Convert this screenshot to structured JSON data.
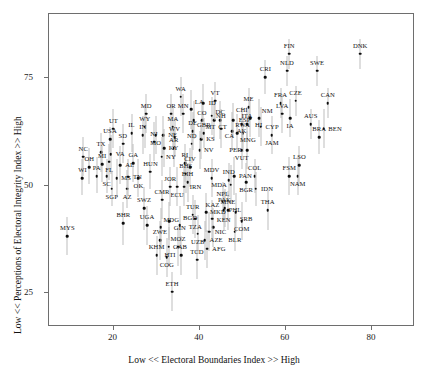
{
  "chart_data": {
    "type": "scatter",
    "title": "",
    "xlabel": "Low << Electoral Boundaries Index >> High",
    "ylabel": "Low << Perceptions of Electoral Integrity Index >> High",
    "xlim": [
      5,
      90
    ],
    "ylim": [
      17,
      90
    ],
    "xticks": [
      20,
      40,
      60,
      80
    ],
    "yticks": [
      25,
      50,
      75
    ],
    "grid": false,
    "legend": null,
    "points": [
      {
        "label": "MYS",
        "x": 9.5,
        "y": 38.0,
        "lo": 33.5,
        "hi": 42.5
      },
      {
        "label": "WI",
        "x": 13.0,
        "y": 51.5,
        "lo": 47.5,
        "hi": 56.0
      },
      {
        "label": "NC",
        "x": 13.2,
        "y": 56.5,
        "lo": 52.0,
        "hi": 61.0
      },
      {
        "label": "OH",
        "x": 14.6,
        "y": 54.0,
        "lo": 50.0,
        "hi": 58.5
      },
      {
        "label": "PA",
        "x": 16.3,
        "y": 52.0,
        "lo": 48.0,
        "hi": 56.5
      },
      {
        "label": "TX",
        "x": 17.3,
        "y": 57.5,
        "lo": 53.0,
        "hi": 62.0
      },
      {
        "label": "MI",
        "x": 17.6,
        "y": 54.8,
        "lo": 50.5,
        "hi": 59.0
      },
      {
        "label": "FL",
        "x": 19.2,
        "y": 55.3,
        "lo": 51.0,
        "hi": 59.5
      },
      {
        "label": "VA",
        "x": 19.6,
        "y": 57.0,
        "lo": 52.5,
        "hi": 61.5
      },
      {
        "label": "SC",
        "x": 18.6,
        "y": 52.0,
        "lo": 48.0,
        "hi": 56.0
      },
      {
        "label": "USA",
        "x": 19.4,
        "y": 60.5,
        "lo": 57.5,
        "hi": 63.5
      },
      {
        "label": "UT",
        "x": 20.2,
        "y": 63.0,
        "lo": 58.5,
        "hi": 67.5
      },
      {
        "label": "SGP",
        "x": 19.8,
        "y": 49.0,
        "lo": 45.0,
        "hi": 53.0
      },
      {
        "label": "MS",
        "x": 21.0,
        "y": 51.5,
        "lo": 47.0,
        "hi": 56.0
      },
      {
        "label": "AL",
        "x": 21.8,
        "y": 54.5,
        "lo": 50.0,
        "hi": 59.0
      },
      {
        "label": "SD",
        "x": 22.4,
        "y": 59.5,
        "lo": 55.0,
        "hi": 64.0
      },
      {
        "label": "BHR",
        "x": 22.5,
        "y": 41.0,
        "lo": 36.0,
        "hi": 46.0
      },
      {
        "label": "AZ",
        "x": 23.4,
        "y": 49.0,
        "lo": 44.5,
        "hi": 53.5
      },
      {
        "label": "TN",
        "x": 23.6,
        "y": 51.8,
        "lo": 47.5,
        "hi": 56.0
      },
      {
        "label": "IL",
        "x": 24.4,
        "y": 62.0,
        "lo": 57.5,
        "hi": 66.5
      },
      {
        "label": "GA",
        "x": 24.8,
        "y": 55.0,
        "lo": 50.5,
        "hi": 59.5
      },
      {
        "label": "OK",
        "x": 26.0,
        "y": 51.5,
        "lo": 47.0,
        "hi": 56.0
      },
      {
        "label": "IN",
        "x": 27.0,
        "y": 61.5,
        "lo": 57.0,
        "hi": 66.0
      },
      {
        "label": "WY",
        "x": 27.5,
        "y": 63.5,
        "lo": 58.5,
        "hi": 68.5
      },
      {
        "label": "MD",
        "x": 27.8,
        "y": 66.5,
        "lo": 62.0,
        "hi": 71.0
      },
      {
        "label": "SWZ",
        "x": 27.3,
        "y": 44.5,
        "lo": 39.5,
        "hi": 49.5
      },
      {
        "label": "UGA",
        "x": 28.0,
        "y": 40.5,
        "lo": 36.0,
        "hi": 45.0
      },
      {
        "label": "HUN",
        "x": 28.8,
        "y": 53.0,
        "lo": 49.0,
        "hi": 57.0
      },
      {
        "label": "NJ",
        "x": 29.6,
        "y": 60.0,
        "lo": 55.5,
        "hi": 64.5
      },
      {
        "label": "MO",
        "x": 30.0,
        "y": 61.5,
        "lo": 57.0,
        "hi": 66.0
      },
      {
        "label": "KHM",
        "x": 30.2,
        "y": 33.5,
        "lo": 29.0,
        "hi": 38.0
      },
      {
        "label": "ZWE",
        "x": 31.0,
        "y": 37.0,
        "lo": 32.5,
        "hi": 41.5
      },
      {
        "label": "MDG",
        "x": 31.2,
        "y": 40.0,
        "lo": 35.5,
        "hi": 44.5
      },
      {
        "label": "NY",
        "x": 31.4,
        "y": 56.5,
        "lo": 52.0,
        "hi": 61.0
      },
      {
        "label": "NE",
        "x": 31.8,
        "y": 61.5,
        "lo": 57.0,
        "hi": 66.0
      },
      {
        "label": "KY",
        "x": 32.0,
        "y": 58.5,
        "lo": 54.0,
        "hi": 63.0
      },
      {
        "label": "CMR",
        "x": 31.5,
        "y": 46.5,
        "lo": 42.0,
        "hi": 51.0
      },
      {
        "label": "COG",
        "x": 32.6,
        "y": 33.0,
        "lo": 28.5,
        "hi": 37.5
      },
      {
        "label": "GAB",
        "x": 33.0,
        "y": 35.5,
        "lo": 31.0,
        "hi": 40.0
      },
      {
        "label": "GIN",
        "x": 33.2,
        "y": 41.5,
        "lo": 37.0,
        "hi": 46.0
      },
      {
        "label": "ETH",
        "x": 33.8,
        "y": 25.0,
        "lo": 20.5,
        "hi": 29.5
      },
      {
        "label": "JOR",
        "x": 33.4,
        "y": 49.5,
        "lo": 45.0,
        "hi": 54.0
      },
      {
        "label": "OR",
        "x": 33.6,
        "y": 66.5,
        "lo": 62.0,
        "hi": 71.0
      },
      {
        "label": "MA",
        "x": 34.0,
        "y": 63.5,
        "lo": 59.0,
        "hi": 68.0
      },
      {
        "label": "AR",
        "x": 34.2,
        "y": 58.5,
        "lo": 54.0,
        "hi": 63.0
      },
      {
        "label": "WV",
        "x": 34.4,
        "y": 61.0,
        "lo": 56.5,
        "hi": 65.5
      },
      {
        "label": "ECU",
        "x": 35.0,
        "y": 49.5,
        "lo": 45.0,
        "hi": 54.0
      },
      {
        "label": "MOZ",
        "x": 35.2,
        "y": 35.5,
        "lo": 31.0,
        "hi": 40.0
      },
      {
        "label": "BGD",
        "x": 35.6,
        "y": 40.5,
        "lo": 36.0,
        "hi": 45.0
      },
      {
        "label": "WA",
        "x": 35.8,
        "y": 70.5,
        "lo": 66.0,
        "hi": 75.0
      },
      {
        "label": "MN",
        "x": 36.4,
        "y": 66.5,
        "lo": 62.0,
        "hi": 71.0
      },
      {
        "label": "HTI",
        "x": 36.0,
        "y": 33.5,
        "lo": 29.0,
        "hi": 38.0
      },
      {
        "label": "IRN",
        "x": 36.6,
        "y": 49.5,
        "lo": 45.0,
        "hi": 54.0
      },
      {
        "label": "RI",
        "x": 36.8,
        "y": 55.0,
        "lo": 50.5,
        "hi": 59.5
      },
      {
        "label": "BHS",
        "x": 37.0,
        "y": 52.5,
        "lo": 48.0,
        "hi": 57.0
      },
      {
        "label": "BIH",
        "x": 37.4,
        "y": 50.5,
        "lo": 46.0,
        "hi": 55.0
      },
      {
        "label": "CIV",
        "x": 38.0,
        "y": 54.0,
        "lo": 49.5,
        "hi": 58.5
      },
      {
        "label": "ND",
        "x": 38.4,
        "y": 59.5,
        "lo": 55.0,
        "hi": 64.0
      },
      {
        "label": "DE",
        "x": 38.6,
        "y": 62.5,
        "lo": 58.0,
        "hi": 67.0
      },
      {
        "label": "CO",
        "x": 38.8,
        "y": 65.0,
        "lo": 60.5,
        "hi": 69.5
      },
      {
        "label": "LA",
        "x": 38.2,
        "y": 67.5,
        "lo": 63.0,
        "hi": 72.0
      },
      {
        "label": "TUR",
        "x": 38.6,
        "y": 43.0,
        "lo": 38.5,
        "hi": 47.5
      },
      {
        "label": "TZA",
        "x": 39.2,
        "y": 42.0,
        "lo": 37.5,
        "hi": 46.5
      },
      {
        "label": "TCD",
        "x": 39.6,
        "y": 32.5,
        "lo": 28.0,
        "hi": 37.0
      },
      {
        "label": "UZB",
        "x": 39.8,
        "y": 38.5,
        "lo": 34.0,
        "hi": 43.0
      },
      {
        "label": "NV",
        "x": 40.2,
        "y": 58.0,
        "lo": 53.5,
        "hi": 62.5
      },
      {
        "label": "KS",
        "x": 40.6,
        "y": 60.5,
        "lo": 56.0,
        "hi": 65.0
      },
      {
        "label": "MT",
        "x": 40.8,
        "y": 65.0,
        "lo": 60.5,
        "hi": 69.5
      },
      {
        "label": "ID",
        "x": 41.0,
        "y": 69.0,
        "lo": 64.5,
        "hi": 73.5
      },
      {
        "label": "GBR",
        "x": 41.2,
        "y": 62.0,
        "lo": 58.5,
        "hi": 65.5
      },
      {
        "label": "AZE",
        "x": 41.4,
        "y": 37.0,
        "lo": 32.5,
        "hi": 41.5
      },
      {
        "label": "MKD",
        "x": 41.8,
        "y": 43.5,
        "lo": 39.0,
        "hi": 48.0
      },
      {
        "label": "AFG",
        "x": 42.0,
        "y": 35.0,
        "lo": 30.5,
        "hi": 39.5
      },
      {
        "label": "NIC",
        "x": 42.4,
        "y": 39.0,
        "lo": 34.5,
        "hi": 43.5
      },
      {
        "label": "NH",
        "x": 43.0,
        "y": 66.0,
        "lo": 61.5,
        "hi": 70.5
      },
      {
        "label": "CT",
        "x": 43.6,
        "y": 65.0,
        "lo": 60.5,
        "hi": 69.5
      },
      {
        "label": "VT",
        "x": 43.8,
        "y": 69.5,
        "lo": 65.0,
        "hi": 74.0
      },
      {
        "label": "KEN",
        "x": 43.4,
        "y": 40.0,
        "lo": 35.5,
        "hi": 44.5
      },
      {
        "label": "KAZ",
        "x": 43.2,
        "y": 42.0,
        "lo": 37.5,
        "hi": 46.5
      },
      {
        "label": "MDV",
        "x": 43.0,
        "y": 51.5,
        "lo": 47.0,
        "hi": 56.0
      },
      {
        "label": "DC",
        "x": 45.0,
        "y": 65.0,
        "lo": 60.5,
        "hi": 69.5
      },
      {
        "label": "CA",
        "x": 45.2,
        "y": 63.0,
        "lo": 58.5,
        "hi": 67.5
      },
      {
        "label": "NPL",
        "x": 45.6,
        "y": 46.0,
        "lo": 41.5,
        "hi": 50.5
      },
      {
        "label": "PHL",
        "x": 45.8,
        "y": 44.0,
        "lo": 39.5,
        "hi": 48.5
      },
      {
        "label": "PAK",
        "x": 46.0,
        "y": 44.5,
        "lo": 40.0,
        "hi": 49.0
      },
      {
        "label": "MNE",
        "x": 46.8,
        "y": 44.0,
        "lo": 39.5,
        "hi": 48.5
      },
      {
        "label": "IND",
        "x": 47.0,
        "y": 51.0,
        "lo": 47.0,
        "hi": 55.0
      },
      {
        "label": "MDA",
        "x": 47.4,
        "y": 50.0,
        "lo": 45.5,
        "hi": 54.5
      },
      {
        "label": "AK",
        "x": 47.8,
        "y": 62.5,
        "lo": 58.0,
        "hi": 67.0
      },
      {
        "label": "ESP",
        "x": 48.0,
        "y": 65.0,
        "lo": 61.0,
        "hi": 69.0
      },
      {
        "label": "PAN",
        "x": 48.2,
        "y": 52.0,
        "lo": 47.5,
        "hi": 56.5
      },
      {
        "label": "BLR",
        "x": 48.4,
        "y": 39.0,
        "lo": 34.5,
        "hi": 43.5
      },
      {
        "label": "SRB",
        "x": 48.6,
        "y": 43.5,
        "lo": 39.0,
        "hi": 48.0
      },
      {
        "label": "MNG",
        "x": 49.0,
        "y": 62.0,
        "lo": 57.5,
        "hi": 66.5
      },
      {
        "label": "RWA",
        "x": 50.2,
        "y": 62.0,
        "lo": 57.5,
        "hi": 66.5
      },
      {
        "label": "VUT",
        "x": 50.0,
        "y": 58.0,
        "lo": 53.5,
        "hi": 62.5
      },
      {
        "label": "PER",
        "x": 51.2,
        "y": 58.0,
        "lo": 53.5,
        "hi": 62.5
      },
      {
        "label": "CHI",
        "x": 50.0,
        "y": 64.0,
        "lo": 60.0,
        "hi": 68.0
      },
      {
        "label": "ITA",
        "x": 51.2,
        "y": 64.0,
        "lo": 60.0,
        "hi": 68.0
      },
      {
        "label": "BGR",
        "x": 51.0,
        "y": 50.5,
        "lo": 46.0,
        "hi": 55.0
      },
      {
        "label": "COM",
        "x": 50.0,
        "y": 41.5,
        "lo": 37.0,
        "hi": 46.0
      },
      {
        "label": "ME",
        "x": 51.6,
        "y": 68.0,
        "lo": 63.5,
        "hi": 72.5
      },
      {
        "label": "HI",
        "x": 52.0,
        "y": 65.5,
        "lo": 61.0,
        "hi": 70.0
      },
      {
        "label": "COL",
        "x": 53.0,
        "y": 52.0,
        "lo": 48.0,
        "hi": 56.0
      },
      {
        "label": "IDN",
        "x": 53.2,
        "y": 49.0,
        "lo": 45.0,
        "hi": 53.0
      },
      {
        "label": "NM",
        "x": 54.0,
        "y": 65.5,
        "lo": 61.0,
        "hi": 70.0
      },
      {
        "label": "CYP",
        "x": 54.4,
        "y": 63.5,
        "lo": 59.0,
        "hi": 68.0
      },
      {
        "label": "CRI",
        "x": 55.5,
        "y": 75.0,
        "lo": 71.0,
        "hi": 79.0
      },
      {
        "label": "THA",
        "x": 56.0,
        "y": 44.0,
        "lo": 39.5,
        "hi": 48.5
      },
      {
        "label": "JAM",
        "x": 57.0,
        "y": 61.5,
        "lo": 57.0,
        "hi": 66.0
      },
      {
        "label": "FRA",
        "x": 59.0,
        "y": 69.0,
        "lo": 65.5,
        "hi": 72.5
      },
      {
        "label": "LVA",
        "x": 59.4,
        "y": 66.5,
        "lo": 62.0,
        "hi": 71.0
      },
      {
        "label": "NLD",
        "x": 60.5,
        "y": 76.5,
        "lo": 73.0,
        "hi": 80.0
      },
      {
        "label": "FIN",
        "x": 61.0,
        "y": 80.5,
        "lo": 77.0,
        "hi": 84.0
      },
      {
        "label": "IA",
        "x": 61.2,
        "y": 65.5,
        "lo": 61.0,
        "hi": 70.0
      },
      {
        "label": "FSM",
        "x": 61.0,
        "y": 52.0,
        "lo": 47.5,
        "hi": 56.5
      },
      {
        "label": "CZE",
        "x": 62.5,
        "y": 69.5,
        "lo": 66.0,
        "hi": 73.0
      },
      {
        "label": "NAM",
        "x": 63.0,
        "y": 52.0,
        "lo": 47.5,
        "hi": 56.5
      },
      {
        "label": "LSO",
        "x": 63.4,
        "y": 54.5,
        "lo": 50.0,
        "hi": 59.0
      },
      {
        "label": "AUS",
        "x": 66.0,
        "y": 64.0,
        "lo": 60.5,
        "hi": 67.5
      },
      {
        "label": "SWE",
        "x": 67.5,
        "y": 76.5,
        "lo": 73.0,
        "hi": 80.0
      },
      {
        "label": "BRA",
        "x": 68.0,
        "y": 61.0,
        "lo": 57.0,
        "hi": 65.0
      },
      {
        "label": "BEN",
        "x": 69.0,
        "y": 63.0,
        "lo": 58.5,
        "hi": 67.5
      },
      {
        "label": "CAN",
        "x": 70.0,
        "y": 69.0,
        "lo": 65.5,
        "hi": 72.5
      },
      {
        "label": "DNK",
        "x": 77.5,
        "y": 80.5,
        "lo": 77.0,
        "hi": 84.0
      }
    ],
    "label_offsets": {
      "note": "Country code text is drawn adjacent to its marker; dx/dy in data-ish pixel nudges"
    }
  },
  "axis": {
    "x_title": "Low << Electoral Boundaries Index >> High",
    "y_title": "Low << Perceptions of Electoral Integrity Index >> High",
    "x_tick_labels": [
      "20",
      "40",
      "60",
      "80"
    ],
    "y_tick_labels": [
      "25",
      "50",
      "75"
    ]
  },
  "style": {
    "point_color": "#0d0d0d",
    "whisker_color": "#bdbdbd",
    "frame_color": "#6e6e6e",
    "background": "#ffffff"
  }
}
